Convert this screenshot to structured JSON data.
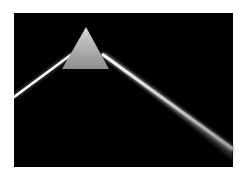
{
  "image": {
    "subject": "prism-dispersing-light-beam",
    "background_color": "#000000",
    "page_color": "#ffffff",
    "prism_color": "#a8a8a8",
    "beam_color": "#ffffff"
  }
}
